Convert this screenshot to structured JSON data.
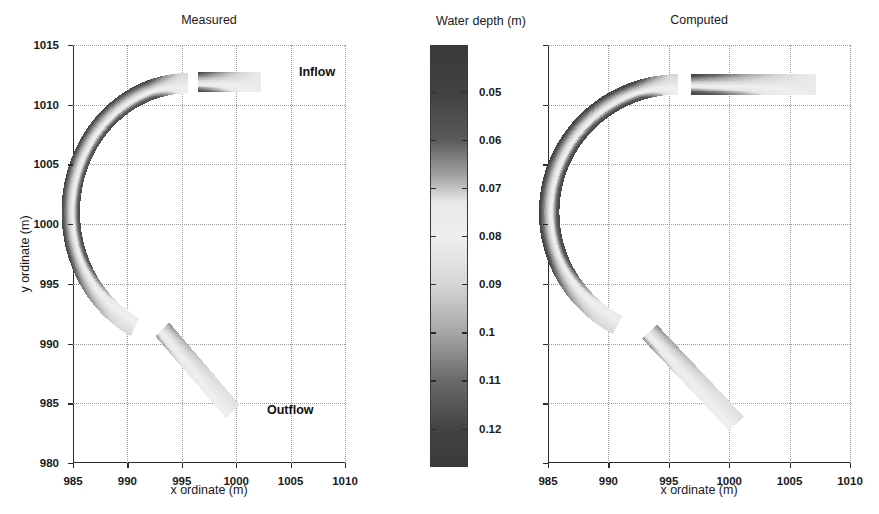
{
  "figure": {
    "width": 879,
    "height": 514,
    "background": "#ffffff",
    "ink": "#1a1a1a",
    "grid_color": "#9a9a9a"
  },
  "chart_data": {
    "type": "heatmap",
    "panels": [
      {
        "id": "measured",
        "title": "Measured",
        "xlabel": "x ordinate (m)",
        "ylabel": "y ordinate (m)",
        "xlim": [
          985,
          1010
        ],
        "ylim": [
          980,
          1015
        ],
        "xticks": [
          985,
          990,
          995,
          1000,
          1005,
          1010
        ],
        "yticks": [
          980,
          985,
          990,
          995,
          1000,
          1005,
          1010,
          1015
        ],
        "xtick_labels": [
          "985",
          "990",
          "995",
          "1000",
          "1005",
          "1010"
        ],
        "ytick_labels": [
          "980",
          "985",
          "990",
          "995",
          "1000",
          "1005",
          "1010",
          "1015"
        ],
        "grid": true,
        "annotations": [
          {
            "text": "Inflow",
            "x": 1002.6,
            "y": 1011.6
          },
          {
            "text": "Outflow",
            "x": 999.9,
            "y": 984.6
          }
        ],
        "channel": {
          "inflow_reach": {
            "from_x": 1002.3,
            "to_x": 996.5,
            "y": 1011.9,
            "width_m": 1.7
          },
          "bend": {
            "center_x": 995.6,
            "center_y": 1001.0,
            "radius_m": 10.8,
            "width_m": 1.7,
            "start_angle_deg": 90,
            "end_angle_deg": 243
          },
          "outflow_reach": {
            "from_x": 993.2,
            "to_x": 999.7,
            "from_y": 991.2,
            "to_y": 984.3,
            "width_m": 1.7
          }
        },
        "depth_across_section": {
          "inner_bank_m": 0.052,
          "channel_axis_m": 0.085,
          "outer_bank_m": 0.122,
          "note": "outer (left/right-hand) bank of the bend is deepest, inner bank shallowest"
        }
      },
      {
        "id": "computed",
        "title": "Computed",
        "xlabel": "x ordinate (m)",
        "ylabel": "",
        "xlim": [
          985,
          1010
        ],
        "ylim": [
          980,
          1015
        ],
        "xticks": [
          985,
          990,
          995,
          1000,
          1005,
          1010
        ],
        "yticks": [
          980,
          985,
          990,
          995,
          1000,
          1005,
          1010,
          1015
        ],
        "xtick_labels": [
          "985",
          "990",
          "995",
          "1000",
          "1005",
          "1010"
        ],
        "ytick_labels": [],
        "grid": true,
        "annotations": [],
        "channel": {
          "inflow_reach": {
            "from_x": 1007.2,
            "to_x": 996.8,
            "y": 1011.7,
            "width_m": 1.7
          },
          "bend": {
            "center_x": 995.8,
            "center_y": 1001.0,
            "radius_m": 10.7,
            "width_m": 1.7,
            "start_angle_deg": 90,
            "end_angle_deg": 242
          },
          "outflow_reach": {
            "from_x": 993.4,
            "to_x": 1000.6,
            "from_y": 991.0,
            "to_y": 983.3,
            "width_m": 1.7
          }
        },
        "depth_across_section": {
          "inner_bank_m": 0.05,
          "channel_axis_m": 0.085,
          "outer_bank_m": 0.124,
          "note": "outer bank of the bend is deepest, inner bank shallowest"
        }
      }
    ],
    "colorbar": {
      "title": "Water depth (m)",
      "orientation": "vertical",
      "colormap": "grayscale-bone-like (dark-light-dark)",
      "vmin": 0.0405,
      "vmax": 0.1278,
      "ticks": [
        0.05,
        0.06,
        0.07,
        0.08,
        0.09,
        0.1,
        0.11,
        0.12
      ],
      "tick_labels": [
        "0.05",
        "0.06",
        "0.07",
        "0.08",
        "0.09",
        "0.1",
        "0.11",
        "0.12"
      ],
      "stops": [
        {
          "value": 0.0405,
          "color": "#3a3a3a"
        },
        {
          "value": 0.05,
          "color": "#414141"
        },
        {
          "value": 0.06,
          "color": "#5a5a5a"
        },
        {
          "value": 0.068,
          "color": "#a8a8a8"
        },
        {
          "value": 0.073,
          "color": "#e8e8e8"
        },
        {
          "value": 0.08,
          "color": "#efefef"
        },
        {
          "value": 0.09,
          "color": "#d6d6d6"
        },
        {
          "value": 0.1,
          "color": "#a6a6a6"
        },
        {
          "value": 0.11,
          "color": "#6a6a6a"
        },
        {
          "value": 0.12,
          "color": "#434343"
        },
        {
          "value": 0.1278,
          "color": "#3a3a3a"
        }
      ]
    }
  }
}
